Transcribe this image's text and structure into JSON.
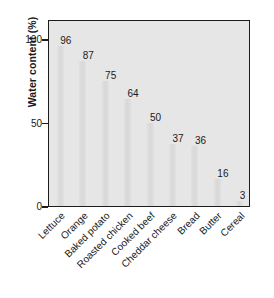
{
  "chart_data": {
    "type": "bar",
    "title": "",
    "xlabel": "",
    "ylabel": "Water content (%)",
    "categories": [
      "Lettuce",
      "Orange",
      "Baked potato",
      "Roasted chicken",
      "Cooked beef",
      "Cheddar cheese",
      "Bread",
      "Butter",
      "Cereal"
    ],
    "values": [
      96,
      87,
      75,
      64,
      50,
      37,
      36,
      16,
      3
    ],
    "value_labels": [
      "96",
      "87",
      "75",
      "64",
      "50",
      "37",
      "36",
      "16",
      "3"
    ],
    "ylim": [
      0,
      112
    ],
    "yticks": [
      0,
      50,
      100
    ],
    "ytick_labels": [
      "0",
      "50",
      "100"
    ],
    "grid": false,
    "legend": null,
    "bar_color": "#dcdcdc",
    "plot_background": "#e6e6e6",
    "axis_color": "#1c1c1c",
    "text_color": "#1a1a1a"
  }
}
